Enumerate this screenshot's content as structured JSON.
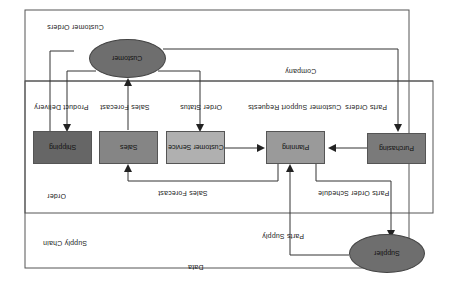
{
  "diagram": {
    "orientation": "rotated-180",
    "colors": {
      "frame": "#555555",
      "ellipse_fill": "#6e6e6e",
      "box_dark": "#666666",
      "box_mid": "#8a8a8a",
      "box_light": "#b0b0b0",
      "box_center": "#9a9a9a",
      "box_right": "#7a7a7a",
      "line": "#333333"
    },
    "ellipses": {
      "top": {
        "label": "Customer"
      },
      "bottom": {
        "label": "Supplier"
      }
    },
    "boxes": [
      {
        "id": "box-1",
        "label": "Shipping"
      },
      {
        "id": "box-2",
        "label": "Sales"
      },
      {
        "id": "box-3",
        "label": "Customer Service"
      },
      {
        "id": "box-4",
        "label": "Planning"
      },
      {
        "id": "box-5",
        "label": "Purchasing"
      }
    ],
    "labels": {
      "top_left_region": "Customer Orders",
      "outer_region": "Company",
      "lane_left": "Order",
      "bottom_left_region": "Supply Chain",
      "bottom_center": "Data",
      "arrow_top_1": "Product Delivery",
      "arrow_top_2": "Sales Forecast",
      "arrow_top_3": "Order Status",
      "arrow_top_4": "Customer Support Requests",
      "arrow_top_5": "Parts Orders",
      "arrow_bottom_center": "Sales Forecast",
      "arrow_bottom_right": "Parts Order Schedule",
      "arrow_bottom_supplier": "Parts Supply"
    }
  }
}
